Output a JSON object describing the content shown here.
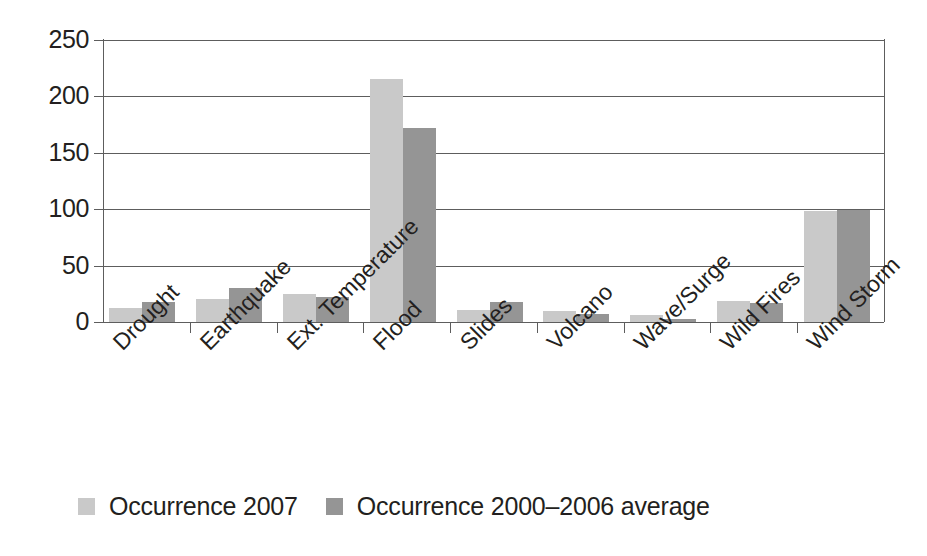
{
  "chart_data": {
    "type": "bar",
    "title": "",
    "subtitle": "",
    "xlabel": "",
    "ylabel": "",
    "ylim": [
      0,
      250
    ],
    "yticks": [
      0,
      50,
      100,
      150,
      200,
      250
    ],
    "ytick_labels": [
      "0",
      "50",
      "100",
      "150",
      "200",
      "250"
    ],
    "grid": true,
    "legend_position": "bottom-left",
    "orientation": "vertical",
    "categories": [
      "Drought",
      "Earthquake",
      "Ext. Temperature",
      "Flood",
      "Slides",
      "Volcano",
      "Wave/Surge",
      "Wild Fires",
      "Wind Storm"
    ],
    "series": [
      {
        "name": "Occurrence 2007",
        "color": "#c9c9c9",
        "values": [
          12,
          20,
          25,
          215,
          11,
          10,
          6,
          19,
          98
        ]
      },
      {
        "name": "Occurrence 2000–2006 average",
        "color": "#959595",
        "values": [
          18,
          30,
          22,
          172,
          18,
          7,
          3,
          17,
          99
        ]
      }
    ]
  },
  "legend": {
    "items": [
      {
        "label": "Occurrence 2007",
        "color": "#c9c9c9"
      },
      {
        "label": "Occurrence 2000–2006 average",
        "color": "#959595"
      }
    ]
  },
  "axes": {
    "line_color": "#5d5d5d",
    "tick_label_color": "#231f20"
  }
}
